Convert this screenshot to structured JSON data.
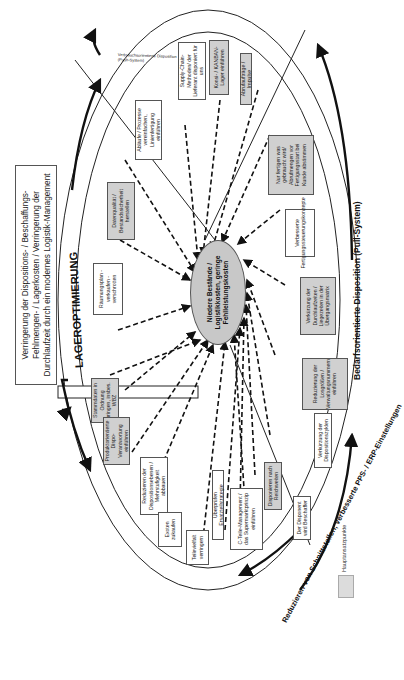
{
  "goal_text": "Verringerung der Dispositions- / Beschaffungs-Fehlmengen- / Lagerkosten / Verringerung der Durchlaufzeit durch ein modernes Logistik-Management",
  "center_text": "Niedere Bestände / Logistikkosten, geringe Fehlleistungskosten",
  "ring_labels": {
    "lageroptimierung": "LAGEROPTIMIERUNG",
    "pps_erp": "Reduzieren von Schnittstellen, verbesserte PPS- / ERP-Einstellungen",
    "pull": "Bedarfsorientierte Disposition (Pull-System)",
    "push_line1": "Verbrauchsorientierte Disposition",
    "push_line2": "(Push-System)"
  },
  "sectors": {
    "lageroptimierung": [
      {
        "text": "Räumungsplan - verkaufen - verschrotten",
        "main": false
      },
      {
        "text": "Datenqualität / Bestandssicherheit herstellen",
        "main": true
      },
      {
        "text": "Abläufe / Prozesse vereinfachen, Linienfertigung einführen",
        "main": false
      }
    ],
    "push_system": [
      {
        "text": "Supply-Chain-Methoden/ der Lieferant disponiert für uns",
        "main": false
      },
      {
        "text": "Konsi- / KANBAN-Lager einführen",
        "main": true
      },
      {
        "text": "Abrufaufträge / Impulse",
        "main": true
      }
    ],
    "pull_system": [
      {
        "text": "Nur fertigen was gebraucht wird/ Abrufmengen vor Fertigungsstart bei Kunde abstimmen",
        "main": true
      },
      {
        "text": "Verbesserte Fertigungssteuerungskonzepte",
        "main": false
      },
      {
        "text": "Verkürzung der Durchlaufzeiten / Liegezeiten in der Übergangsmatrix",
        "main": true
      },
      {
        "text": "Reduzierung der Losgrößen / Verwaltungsnummern einführen",
        "main": true
      },
      {
        "text": "Verkürzung der Dispositionszyklen",
        "main": false
      },
      {
        "text": "Disponieren nach Reichweiten",
        "main": true
      },
      {
        "text": "Der Disponent wird Beschaffer",
        "main": false
      }
    ],
    "pps_erp": [
      {
        "text": "Stammdaten in Ordnung bringen, insbes. WBZ",
        "main": true
      },
      {
        "text": "Produktorientierte Dispo-Verantwortung einführen",
        "main": true
      },
      {
        "text": "Reduzieren der Dispositionsebenen / Mehrstufigkeit abbauen",
        "main": false
      },
      {
        "text": "Exoten zukaufen",
        "main": false
      },
      {
        "text": "Teilevielfalt verringern",
        "main": false
      },
      {
        "text": "Überprüfen Ersatzteilstrategie",
        "main": false
      },
      {
        "text": "C-Teile-Management / das Supermarktprinzip einführen",
        "main": false
      }
    ]
  },
  "legend": {
    "label": "Hauptansatzpunkte",
    "swatch_color": "#dcdcdc"
  },
  "colors": {
    "main_box": "#d0d0d0",
    "center": "#c8c8c8",
    "line": "#111111"
  }
}
